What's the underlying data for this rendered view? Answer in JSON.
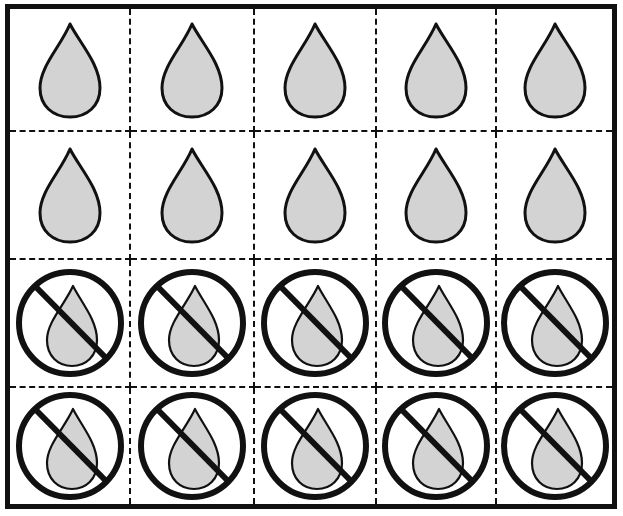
{
  "worksheet": {
    "rows": 4,
    "columns": 5,
    "colors": {
      "outline": "#111111",
      "drop_fill": "#d3d3d3",
      "background": "#ffffff"
    },
    "cells": [
      {
        "row": 1,
        "col": 1,
        "icon": "water-drop"
      },
      {
        "row": 1,
        "col": 2,
        "icon": "water-drop"
      },
      {
        "row": 1,
        "col": 3,
        "icon": "water-drop"
      },
      {
        "row": 1,
        "col": 4,
        "icon": "water-drop"
      },
      {
        "row": 1,
        "col": 5,
        "icon": "water-drop"
      },
      {
        "row": 2,
        "col": 1,
        "icon": "water-drop"
      },
      {
        "row": 2,
        "col": 2,
        "icon": "water-drop"
      },
      {
        "row": 2,
        "col": 3,
        "icon": "water-drop"
      },
      {
        "row": 2,
        "col": 4,
        "icon": "water-drop"
      },
      {
        "row": 2,
        "col": 5,
        "icon": "water-drop"
      },
      {
        "row": 3,
        "col": 1,
        "icon": "no-water-drop"
      },
      {
        "row": 3,
        "col": 2,
        "icon": "no-water-drop"
      },
      {
        "row": 3,
        "col": 3,
        "icon": "no-water-drop"
      },
      {
        "row": 3,
        "col": 4,
        "icon": "no-water-drop"
      },
      {
        "row": 3,
        "col": 5,
        "icon": "no-water-drop"
      },
      {
        "row": 4,
        "col": 1,
        "icon": "no-water-drop"
      },
      {
        "row": 4,
        "col": 2,
        "icon": "no-water-drop"
      },
      {
        "row": 4,
        "col": 3,
        "icon": "no-water-drop"
      },
      {
        "row": 4,
        "col": 4,
        "icon": "no-water-drop"
      },
      {
        "row": 4,
        "col": 5,
        "icon": "no-water-drop"
      }
    ]
  }
}
